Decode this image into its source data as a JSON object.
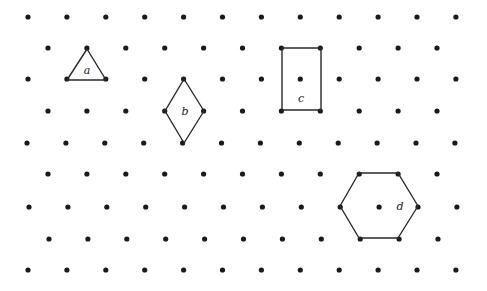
{
  "grid": {
    "type": "isometric-dot-grid",
    "dot_color": "#1a1a1a",
    "dot_radius": 2.6,
    "rows": [
      {
        "y": 17,
        "x_start": 28,
        "count": 12
      },
      {
        "y": 48,
        "x_start": 48,
        "count": 11
      },
      {
        "y": 79,
        "x_start": 28,
        "count": 12
      },
      {
        "y": 111,
        "x_start": 48,
        "count": 11
      },
      {
        "y": 143,
        "x_start": 27,
        "count": 12
      },
      {
        "y": 174,
        "x_start": 48,
        "count": 11
      },
      {
        "y": 207,
        "x_start": 29,
        "count": 12
      },
      {
        "y": 239,
        "x_start": 49,
        "count": 11
      },
      {
        "y": 270,
        "x_start": 28,
        "count": 12
      }
    ],
    "spacing": 38.9
  },
  "shapes": [
    {
      "id": "a",
      "kind": "triangle",
      "label": "a",
      "points": [
        [
          87,
          49
        ],
        [
          106,
          80
        ],
        [
          67,
          80
        ]
      ],
      "label_pos": [
        87,
        71
      ]
    },
    {
      "id": "b",
      "kind": "rhombus",
      "label": "b",
      "points": [
        [
          184,
          79
        ],
        [
          204,
          111
        ],
        [
          184,
          143
        ],
        [
          165,
          111
        ]
      ],
      "label_pos": [
        185,
        112
      ]
    },
    {
      "id": "c",
      "kind": "rectangle",
      "label": "c",
      "points": [
        [
          282,
          48
        ],
        [
          321,
          48
        ],
        [
          321,
          110
        ],
        [
          282,
          110
        ]
      ],
      "label_pos": [
        301,
        99
      ]
    },
    {
      "id": "d",
      "kind": "hexagon",
      "label": "d",
      "points": [
        [
          359,
          173
        ],
        [
          398,
          173
        ],
        [
          418,
          206
        ],
        [
          398,
          238
        ],
        [
          359,
          238
        ],
        [
          340,
          206
        ]
      ],
      "label_pos": [
        400,
        207
      ]
    }
  ]
}
